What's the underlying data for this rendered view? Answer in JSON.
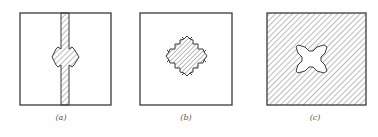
{
  "figure": {
    "panels": [
      {
        "id": "a",
        "label": "(a)",
        "description": "Unhatched square with a hatched vertical strip through the center, widened into an arrow-shaped hexagonal bulge at mid-height"
      },
      {
        "id": "b",
        "label": "(b)",
        "description": "Unhatched square containing a hatched cross-shaped (plus) region with barbed arrow tips pointing outward in four directions"
      },
      {
        "id": "c",
        "label": "(c)",
        "description": "Fully hatched square containing an unhatched X-shaped cavity with arrow tips at the four diagonal corners"
      }
    ],
    "colors": {
      "stroke": "#3a3a3a",
      "hatch": "#6a6a6a",
      "background": "#ffffff",
      "caption": "#555555"
    }
  }
}
